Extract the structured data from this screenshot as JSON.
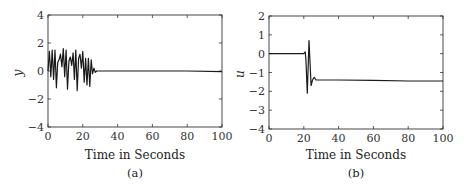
{
  "chart_data": [
    {
      "type": "line",
      "panel": "(a)",
      "caption": "(a)",
      "title": "",
      "xlabel": "Time in Seconds",
      "ylabel": "y",
      "xlim": [
        0,
        100
      ],
      "ylim": [
        -4,
        4
      ],
      "xticks": [
        0,
        20,
        40,
        60,
        80,
        100
      ],
      "yticks": [
        -4,
        -2,
        0,
        2,
        4
      ],
      "grid": false,
      "series": [
        {
          "name": "y",
          "x": [
            0,
            0.8,
            1.6,
            2.4,
            3.2,
            4,
            4.8,
            5.6,
            6.4,
            7.2,
            8,
            8.8,
            9.6,
            10.4,
            11.2,
            12,
            12.8,
            13.6,
            14.4,
            15.2,
            16,
            16.8,
            17.6,
            18.4,
            19.2,
            20,
            20.8,
            21.6,
            22.4,
            23.2,
            24,
            24.8,
            25.6,
            26.4,
            27.2,
            28,
            30,
            40,
            60,
            80,
            100
          ],
          "y": [
            0,
            1.4,
            -0.4,
            1.5,
            -0.6,
            1.5,
            -1.2,
            0.6,
            0.8,
            1.2,
            0.3,
            1.6,
            -0.4,
            1.5,
            -1.3,
            0.7,
            1.0,
            0.4,
            1.3,
            -0.6,
            1.5,
            -1.4,
            0.9,
            1.2,
            0.2,
            1.4,
            -0.8,
            0.9,
            -1.0,
            0.9,
            -1.1,
            0.8,
            -0.2,
            0.2,
            -0.1,
            0.0,
            0.0,
            0.0,
            0.0,
            0.0,
            -0.05
          ]
        }
      ]
    },
    {
      "type": "line",
      "panel": "(b)",
      "caption": "(b)",
      "title": "",
      "xlabel": "Time in Seconds",
      "ylabel": "u",
      "xlim": [
        0,
        100
      ],
      "ylim": [
        -4,
        2
      ],
      "xticks": [
        0,
        20,
        40,
        60,
        80,
        100
      ],
      "yticks": [
        -4,
        -3,
        -2,
        -1,
        0,
        1,
        2
      ],
      "grid": false,
      "series": [
        {
          "name": "u",
          "x": [
            0,
            20,
            20.8,
            21.2,
            22,
            23,
            24.2,
            25,
            26,
            27,
            28,
            40,
            60,
            80,
            100
          ],
          "y": [
            0,
            0,
            0.1,
            -0.3,
            -2.1,
            0.7,
            -1.7,
            -1.4,
            -1.25,
            -1.4,
            -1.4,
            -1.4,
            -1.42,
            -1.45,
            -1.45
          ]
        }
      ]
    }
  ]
}
